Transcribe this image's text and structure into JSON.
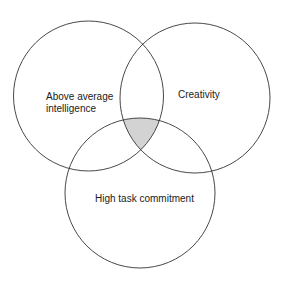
{
  "diagram": {
    "type": "venn",
    "circles": [
      {
        "id": "intelligence",
        "label_lines": [
          "Above average",
          "intelligence"
        ]
      },
      {
        "id": "creativity",
        "label_lines": [
          "Creativity"
        ]
      },
      {
        "id": "commitment",
        "label_lines": [
          "High task commitment"
        ]
      }
    ],
    "intersection": {
      "shaded": true,
      "fill": "#d3d3d3"
    },
    "colors": {
      "stroke": "#333333",
      "background": "#ffffff",
      "text": "#1a1a1a"
    }
  }
}
